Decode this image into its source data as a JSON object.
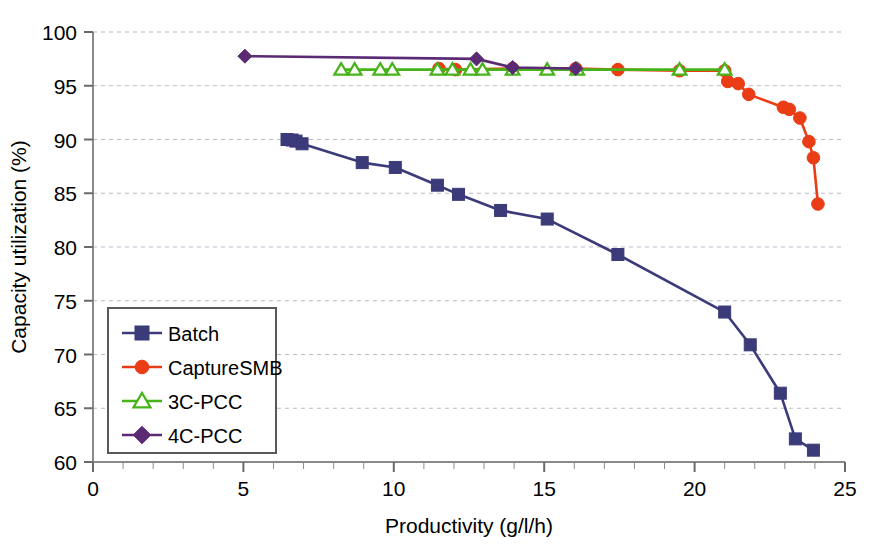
{
  "chart_data": {
    "type": "line",
    "title": "",
    "xlabel": "Productivity (g/l/h)",
    "ylabel": "Capacity utilization (%)",
    "xlim": [
      0,
      25
    ],
    "ylim": [
      60,
      100
    ],
    "xticks": [
      0,
      5,
      10,
      15,
      20,
      25
    ],
    "yticks": [
      60,
      65,
      70,
      75,
      80,
      85,
      90,
      95,
      100
    ],
    "xtick_labels": [
      "0",
      "5",
      "10",
      "15",
      "20",
      "25"
    ],
    "ytick_labels": [
      "60",
      "65",
      "70",
      "75",
      "80",
      "85",
      "90",
      "95",
      "100"
    ],
    "x_minor_tick_step": 1,
    "grid": "horizontal-dashed",
    "legend_position": "lower-left-inside",
    "series": [
      {
        "name": "Batch",
        "color": "#3b3b7a",
        "marker": "square",
        "marker_filled": true,
        "points": [
          [
            6.45,
            90.0
          ],
          [
            6.62,
            89.95
          ],
          [
            6.75,
            89.85
          ],
          [
            6.95,
            89.6
          ],
          [
            8.95,
            87.85
          ],
          [
            10.05,
            87.4
          ],
          [
            11.45,
            85.75
          ],
          [
            12.15,
            84.9
          ],
          [
            13.55,
            83.4
          ],
          [
            15.1,
            82.6
          ],
          [
            17.45,
            79.3
          ],
          [
            21.0,
            73.95
          ],
          [
            21.85,
            70.9
          ],
          [
            22.85,
            66.4
          ],
          [
            23.35,
            62.15
          ],
          [
            23.95,
            61.1
          ]
        ]
      },
      {
        "name": "CaptureSMB",
        "color": "#ea3c15",
        "marker": "circle",
        "marker_filled": true,
        "points": [
          [
            11.5,
            96.6
          ],
          [
            12.05,
            96.5
          ],
          [
            13.95,
            96.6
          ],
          [
            16.05,
            96.6
          ],
          [
            17.45,
            96.5
          ],
          [
            19.5,
            96.4
          ],
          [
            21.0,
            96.4
          ],
          [
            21.1,
            95.4
          ],
          [
            21.45,
            95.2
          ],
          [
            21.8,
            94.2
          ],
          [
            22.95,
            93.0
          ],
          [
            23.15,
            92.8
          ],
          [
            23.5,
            92.0
          ],
          [
            23.8,
            89.8
          ],
          [
            23.95,
            88.3
          ],
          [
            24.1,
            84.0
          ]
        ]
      },
      {
        "name": "3C-PCC",
        "color": "#46b419",
        "marker": "triangle",
        "marker_filled": false,
        "points": [
          [
            8.25,
            96.5
          ],
          [
            8.7,
            96.5
          ],
          [
            9.55,
            96.5
          ],
          [
            9.95,
            96.5
          ],
          [
            11.45,
            96.5
          ],
          [
            11.95,
            96.5
          ],
          [
            12.55,
            96.5
          ],
          [
            12.95,
            96.5
          ],
          [
            13.95,
            96.5
          ],
          [
            15.1,
            96.5
          ],
          [
            16.1,
            96.5
          ],
          [
            19.5,
            96.5
          ],
          [
            21.0,
            96.5
          ]
        ]
      },
      {
        "name": "4C-PCC",
        "color": "#5b2a74",
        "marker": "diamond",
        "marker_filled": true,
        "points": [
          [
            5.05,
            97.75
          ],
          [
            12.75,
            97.5
          ],
          [
            13.95,
            96.7
          ],
          [
            16.05,
            96.6
          ]
        ]
      }
    ]
  },
  "legend": {
    "entries": [
      {
        "label": "Batch"
      },
      {
        "label": "CaptureSMB"
      },
      {
        "label": "3C-PCC"
      },
      {
        "label": "4C-PCC"
      }
    ]
  },
  "axes": {
    "x_title": "Productivity (g/l/h)",
    "y_title": "Capacity utilization (%)"
  }
}
